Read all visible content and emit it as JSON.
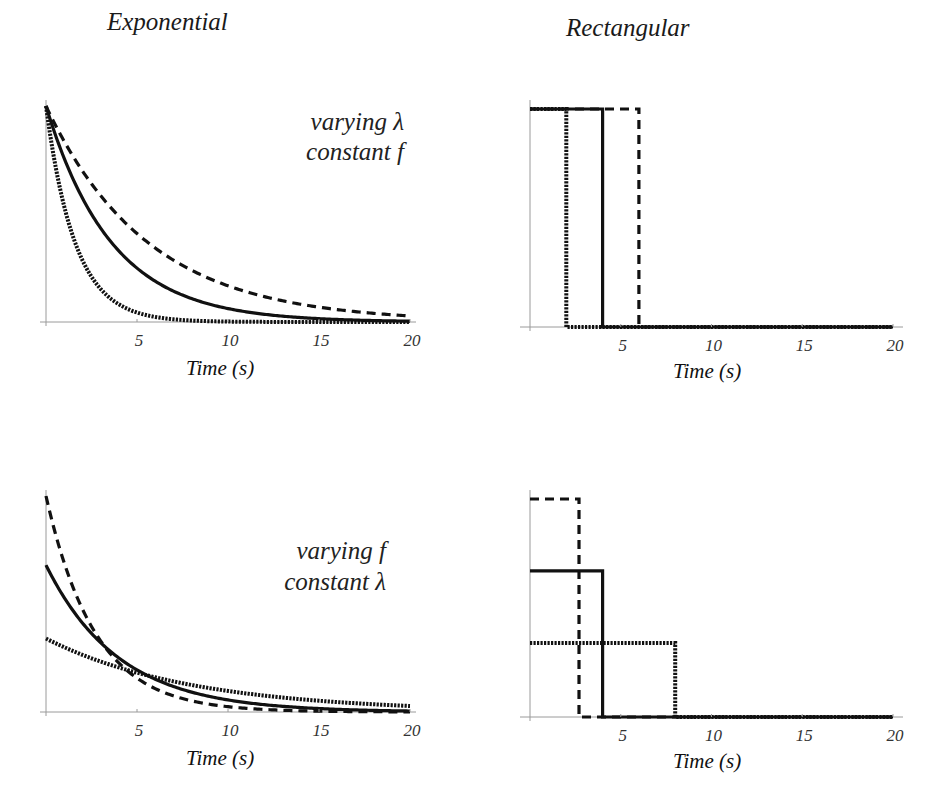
{
  "columns": {
    "left_title": "Exponential",
    "right_title": "Rectangular"
  },
  "chart_data": [
    {
      "id": "exp-varying-lambda",
      "type": "line",
      "title": "Exponential",
      "annotation": [
        "varying λ",
        "constant f"
      ],
      "xlabel": "Time (s)",
      "ylabel": "",
      "xlim": [
        0,
        20
      ],
      "xticks": [
        5,
        10,
        15,
        20
      ],
      "yticks": [],
      "grid": false,
      "series": [
        {
          "name": "fast decay",
          "style": "dotted",
          "formula": "A*exp(-t/tau)",
          "A": 1.0,
          "tau": 1.6
        },
        {
          "name": "medium decay",
          "style": "solid",
          "formula": "A*exp(-t/tau)",
          "A": 1.0,
          "tau": 3.6
        },
        {
          "name": "slow decay",
          "style": "dashed",
          "formula": "A*exp(-t/tau)",
          "A": 1.0,
          "tau": 5.6
        }
      ]
    },
    {
      "id": "rect-varying-lambda",
      "type": "line",
      "title": "Rectangular",
      "xlabel": "Time (s)",
      "ylabel": "",
      "xlim": [
        0,
        20
      ],
      "xticks": [
        5,
        10,
        15,
        20
      ],
      "yticks": [],
      "grid": false,
      "series": [
        {
          "name": "short pulse",
          "style": "dotted",
          "height": 1.0,
          "width": 2
        },
        {
          "name": "medium pulse",
          "style": "solid",
          "height": 1.0,
          "width": 4
        },
        {
          "name": "long pulse",
          "style": "dashed",
          "height": 1.0,
          "width": 6
        }
      ]
    },
    {
      "id": "exp-varying-f",
      "type": "line",
      "title": "Exponential",
      "annotation": [
        "varying f",
        "constant λ"
      ],
      "xlabel": "Time (s)",
      "ylabel": "",
      "xlim": [
        0,
        20
      ],
      "xticks": [
        5,
        10,
        15,
        20
      ],
      "yticks": [],
      "grid": false,
      "series": [
        {
          "name": "high amplitude",
          "style": "dashed",
          "formula": "A*exp(-t/tau)",
          "A": 1.0,
          "tau": 2.7
        },
        {
          "name": "medium amplitude",
          "style": "solid",
          "formula": "A*exp(-t/tau)",
          "A": 0.68,
          "tau": 4.0
        },
        {
          "name": "low amplitude",
          "style": "dotted",
          "formula": "A*exp(-t/tau)",
          "A": 0.34,
          "tau": 8.0
        }
      ]
    },
    {
      "id": "rect-varying-f",
      "type": "line",
      "title": "Rectangular",
      "xlabel": "Time (s)",
      "ylabel": "",
      "xlim": [
        0,
        20
      ],
      "xticks": [
        5,
        10,
        15,
        20
      ],
      "yticks": [],
      "grid": false,
      "series": [
        {
          "name": "tall narrow pulse",
          "style": "dashed",
          "height": 1.0,
          "width": 2.7
        },
        {
          "name": "medium pulse",
          "style": "solid",
          "height": 0.67,
          "width": 4
        },
        {
          "name": "short wide pulse",
          "style": "dotted",
          "height": 0.34,
          "width": 8
        }
      ]
    }
  ]
}
